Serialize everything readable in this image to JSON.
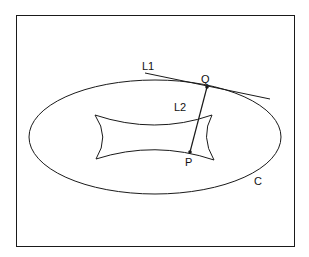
{
  "diagram": {
    "labels": {
      "tangent_line": "L1",
      "connecting_line": "L2",
      "point_on_curve": "Q",
      "point_inside": "P",
      "curve": "C"
    },
    "colors": {
      "stroke": "#1a1a1a",
      "background": "#ffffff"
    }
  }
}
